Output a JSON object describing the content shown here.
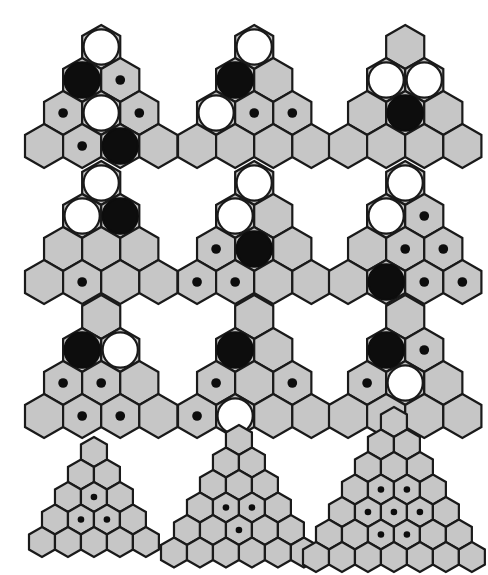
{
  "page": {
    "background_color": "#ffffff",
    "width": 475,
    "height": 567,
    "colors": {
      "hex_fill": "#c6c6c6",
      "hex_stroke": "#1a1a1a",
      "white_piece": "#ffffff",
      "black_piece": "#0d0d0d",
      "dot": "#0d0d0d"
    },
    "legend": {
      "white_circle": "large-white-stone",
      "black_circle": "large-black-stone",
      "small_dot": "small-black-marker",
      "empty": "empty-cell"
    }
  },
  "grid": {
    "rows": 4,
    "cols": 3,
    "description": "4 rows x 3 columns of triangular hexagon boards"
  },
  "figures": [
    {
      "id": "fig-1",
      "row": 1,
      "col": 1,
      "label": "figure-r1c1",
      "board_rows": 4,
      "hex_radius": 22,
      "origin": {
        "x": 22,
        "y": 22
      },
      "cells": [
        {
          "row": 1,
          "pos": 1,
          "mark": "white"
        },
        {
          "row": 2,
          "pos": 1,
          "mark": "black"
        },
        {
          "row": 2,
          "pos": 2,
          "mark": "dot"
        },
        {
          "row": 3,
          "pos": 1,
          "mark": "dot"
        },
        {
          "row": 3,
          "pos": 2,
          "mark": "white"
        },
        {
          "row": 3,
          "pos": 3,
          "mark": "dot"
        },
        {
          "row": 4,
          "pos": 1,
          "mark": "empty"
        },
        {
          "row": 4,
          "pos": 2,
          "mark": "dot"
        },
        {
          "row": 4,
          "pos": 3,
          "mark": "black"
        },
        {
          "row": 4,
          "pos": 4,
          "mark": "empty"
        }
      ]
    },
    {
      "id": "fig-2",
      "row": 1,
      "col": 2,
      "label": "figure-r1c2",
      "board_rows": 4,
      "hex_radius": 22,
      "origin": {
        "x": 175,
        "y": 22
      },
      "cells": [
        {
          "row": 1,
          "pos": 1,
          "mark": "white"
        },
        {
          "row": 2,
          "pos": 1,
          "mark": "black"
        },
        {
          "row": 2,
          "pos": 2,
          "mark": "empty"
        },
        {
          "row": 3,
          "pos": 1,
          "mark": "white"
        },
        {
          "row": 3,
          "pos": 2,
          "mark": "dot"
        },
        {
          "row": 3,
          "pos": 3,
          "mark": "dot"
        },
        {
          "row": 4,
          "pos": 1,
          "mark": "empty"
        },
        {
          "row": 4,
          "pos": 2,
          "mark": "empty"
        },
        {
          "row": 4,
          "pos": 3,
          "mark": "empty"
        },
        {
          "row": 4,
          "pos": 4,
          "mark": "empty"
        }
      ]
    },
    {
      "id": "fig-3",
      "row": 1,
      "col": 3,
      "label": "figure-r1c3",
      "board_rows": 4,
      "hex_radius": 22,
      "origin": {
        "x": 326,
        "y": 22
      },
      "cells": [
        {
          "row": 1,
          "pos": 1,
          "mark": "empty"
        },
        {
          "row": 2,
          "pos": 1,
          "mark": "white"
        },
        {
          "row": 2,
          "pos": 2,
          "mark": "white"
        },
        {
          "row": 3,
          "pos": 1,
          "mark": "empty"
        },
        {
          "row": 3,
          "pos": 2,
          "mark": "black"
        },
        {
          "row": 3,
          "pos": 3,
          "mark": "empty"
        },
        {
          "row": 4,
          "pos": 1,
          "mark": "empty"
        },
        {
          "row": 4,
          "pos": 2,
          "mark": "empty"
        },
        {
          "row": 4,
          "pos": 3,
          "mark": "empty"
        },
        {
          "row": 4,
          "pos": 4,
          "mark": "empty"
        }
      ]
    },
    {
      "id": "fig-4",
      "row": 2,
      "col": 1,
      "label": "figure-r2c1",
      "board_rows": 4,
      "hex_radius": 22,
      "origin": {
        "x": 22,
        "y": 158
      },
      "cells": [
        {
          "row": 1,
          "pos": 1,
          "mark": "white"
        },
        {
          "row": 2,
          "pos": 1,
          "mark": "white"
        },
        {
          "row": 2,
          "pos": 2,
          "mark": "black"
        },
        {
          "row": 3,
          "pos": 1,
          "mark": "empty"
        },
        {
          "row": 3,
          "pos": 2,
          "mark": "empty"
        },
        {
          "row": 3,
          "pos": 3,
          "mark": "empty"
        },
        {
          "row": 4,
          "pos": 1,
          "mark": "empty"
        },
        {
          "row": 4,
          "pos": 2,
          "mark": "dot"
        },
        {
          "row": 4,
          "pos": 3,
          "mark": "empty"
        },
        {
          "row": 4,
          "pos": 4,
          "mark": "empty"
        }
      ]
    },
    {
      "id": "fig-5",
      "row": 2,
      "col": 2,
      "label": "figure-r2c2",
      "board_rows": 4,
      "hex_radius": 22,
      "origin": {
        "x": 175,
        "y": 158
      },
      "cells": [
        {
          "row": 1,
          "pos": 1,
          "mark": "white"
        },
        {
          "row": 2,
          "pos": 1,
          "mark": "white"
        },
        {
          "row": 2,
          "pos": 2,
          "mark": "empty"
        },
        {
          "row": 3,
          "pos": 1,
          "mark": "dot"
        },
        {
          "row": 3,
          "pos": 2,
          "mark": "black"
        },
        {
          "row": 3,
          "pos": 3,
          "mark": "empty"
        },
        {
          "row": 4,
          "pos": 1,
          "mark": "dot"
        },
        {
          "row": 4,
          "pos": 2,
          "mark": "dot"
        },
        {
          "row": 4,
          "pos": 3,
          "mark": "empty"
        },
        {
          "row": 4,
          "pos": 4,
          "mark": "empty"
        }
      ]
    },
    {
      "id": "fig-6",
      "row": 2,
      "col": 3,
      "label": "figure-r2c3",
      "board_rows": 4,
      "hex_radius": 22,
      "origin": {
        "x": 326,
        "y": 158
      },
      "cells": [
        {
          "row": 1,
          "pos": 1,
          "mark": "white"
        },
        {
          "row": 2,
          "pos": 1,
          "mark": "white"
        },
        {
          "row": 2,
          "pos": 2,
          "mark": "dot"
        },
        {
          "row": 3,
          "pos": 1,
          "mark": "empty"
        },
        {
          "row": 3,
          "pos": 2,
          "mark": "dot"
        },
        {
          "row": 3,
          "pos": 3,
          "mark": "dot"
        },
        {
          "row": 4,
          "pos": 1,
          "mark": "empty"
        },
        {
          "row": 4,
          "pos": 2,
          "mark": "black"
        },
        {
          "row": 4,
          "pos": 3,
          "mark": "dot"
        },
        {
          "row": 4,
          "pos": 4,
          "mark": "dot"
        }
      ]
    },
    {
      "id": "fig-7",
      "row": 3,
      "col": 1,
      "label": "figure-r3c1",
      "board_rows": 4,
      "hex_radius": 22,
      "origin": {
        "x": 22,
        "y": 292
      },
      "cells": [
        {
          "row": 1,
          "pos": 1,
          "mark": "empty"
        },
        {
          "row": 2,
          "pos": 1,
          "mark": "black"
        },
        {
          "row": 2,
          "pos": 2,
          "mark": "white"
        },
        {
          "row": 3,
          "pos": 1,
          "mark": "dot"
        },
        {
          "row": 3,
          "pos": 2,
          "mark": "dot"
        },
        {
          "row": 3,
          "pos": 3,
          "mark": "empty"
        },
        {
          "row": 4,
          "pos": 1,
          "mark": "empty"
        },
        {
          "row": 4,
          "pos": 2,
          "mark": "dot"
        },
        {
          "row": 4,
          "pos": 3,
          "mark": "dot"
        },
        {
          "row": 4,
          "pos": 4,
          "mark": "empty"
        }
      ]
    },
    {
      "id": "fig-8",
      "row": 3,
      "col": 2,
      "label": "figure-r3c2",
      "board_rows": 4,
      "hex_radius": 22,
      "origin": {
        "x": 175,
        "y": 292
      },
      "cells": [
        {
          "row": 1,
          "pos": 1,
          "mark": "empty"
        },
        {
          "row": 2,
          "pos": 1,
          "mark": "black"
        },
        {
          "row": 2,
          "pos": 2,
          "mark": "empty"
        },
        {
          "row": 3,
          "pos": 1,
          "mark": "dot"
        },
        {
          "row": 3,
          "pos": 2,
          "mark": "empty"
        },
        {
          "row": 3,
          "pos": 3,
          "mark": "dot"
        },
        {
          "row": 4,
          "pos": 1,
          "mark": "dot"
        },
        {
          "row": 4,
          "pos": 2,
          "mark": "white"
        },
        {
          "row": 4,
          "pos": 3,
          "mark": "empty"
        },
        {
          "row": 4,
          "pos": 4,
          "mark": "empty"
        }
      ]
    },
    {
      "id": "fig-9",
      "row": 3,
      "col": 3,
      "label": "figure-r3c3",
      "board_rows": 4,
      "hex_radius": 22,
      "origin": {
        "x": 326,
        "y": 292
      },
      "cells": [
        {
          "row": 1,
          "pos": 1,
          "mark": "empty"
        },
        {
          "row": 2,
          "pos": 1,
          "mark": "black"
        },
        {
          "row": 2,
          "pos": 2,
          "mark": "dot"
        },
        {
          "row": 3,
          "pos": 1,
          "mark": "dot"
        },
        {
          "row": 3,
          "pos": 2,
          "mark": "white"
        },
        {
          "row": 3,
          "pos": 3,
          "mark": "empty"
        },
        {
          "row": 4,
          "pos": 1,
          "mark": "empty"
        },
        {
          "row": 4,
          "pos": 2,
          "mark": "empty"
        },
        {
          "row": 4,
          "pos": 3,
          "mark": "empty"
        },
        {
          "row": 4,
          "pos": 4,
          "mark": "empty"
        }
      ]
    },
    {
      "id": "fig-10",
      "row": 4,
      "col": 1,
      "label": "figure-r4c1",
      "board_rows": 5,
      "hex_radius": 15,
      "origin": {
        "x": 26,
        "y": 434
      },
      "cells": [
        {
          "row": 3,
          "pos": 2,
          "mark": "dot"
        },
        {
          "row": 4,
          "pos": 2,
          "mark": "dot"
        },
        {
          "row": 4,
          "pos": 3,
          "mark": "dot"
        }
      ]
    },
    {
      "id": "fig-11",
      "row": 4,
      "col": 2,
      "label": "figure-r4c2",
      "board_rows": 6,
      "hex_radius": 15,
      "origin": {
        "x": 158,
        "y": 422
      },
      "cells": [
        {
          "row": 4,
          "pos": 2,
          "mark": "dot"
        },
        {
          "row": 4,
          "pos": 3,
          "mark": "dot"
        },
        {
          "row": 5,
          "pos": 3,
          "mark": "dot"
        }
      ]
    },
    {
      "id": "fig-12",
      "row": 4,
      "col": 3,
      "label": "figure-r4c3",
      "board_rows": 7,
      "hex_radius": 15,
      "origin": {
        "x": 300,
        "y": 404
      },
      "cells": [
        {
          "row": 4,
          "pos": 2,
          "mark": "dot"
        },
        {
          "row": 4,
          "pos": 3,
          "mark": "dot"
        },
        {
          "row": 5,
          "pos": 2,
          "mark": "dot"
        },
        {
          "row": 5,
          "pos": 3,
          "mark": "dot"
        },
        {
          "row": 5,
          "pos": 4,
          "mark": "dot"
        },
        {
          "row": 6,
          "pos": 3,
          "mark": "dot"
        },
        {
          "row": 6,
          "pos": 4,
          "mark": "dot"
        }
      ]
    }
  ]
}
